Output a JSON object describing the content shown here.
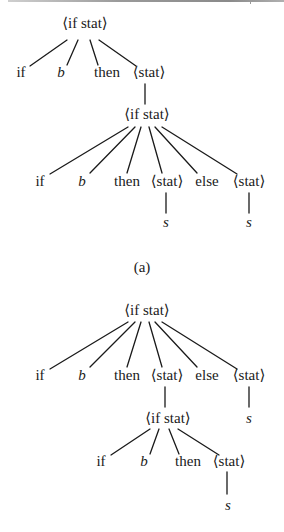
{
  "figure": {
    "caption_a": "(a)",
    "trees": [
      {
        "id": "tree-a",
        "nodes": [
          {
            "id": "a_root",
            "label": "⟨if stat⟩",
            "x": 85,
            "y": 28,
            "italic": false
          },
          {
            "id": "a_if",
            "label": "if",
            "x": 21,
            "y": 77,
            "italic": false
          },
          {
            "id": "a_b",
            "label": "b",
            "x": 61,
            "y": 77,
            "italic": true
          },
          {
            "id": "a_then",
            "label": "then",
            "x": 107,
            "y": 77,
            "italic": false
          },
          {
            "id": "a_stat",
            "label": "⟨stat⟩",
            "x": 149,
            "y": 77,
            "italic": false
          },
          {
            "id": "a_if2",
            "label": "⟨if stat⟩",
            "x": 147,
            "y": 119,
            "italic": false
          },
          {
            "id": "a2_if",
            "label": "if",
            "x": 40,
            "y": 186,
            "italic": false
          },
          {
            "id": "a2_b",
            "label": "b",
            "x": 82,
            "y": 186,
            "italic": true
          },
          {
            "id": "a2_then",
            "label": "then",
            "x": 127,
            "y": 186,
            "italic": false
          },
          {
            "id": "a2_stat1",
            "label": "⟨stat⟩",
            "x": 167,
            "y": 186,
            "italic": false
          },
          {
            "id": "a2_else",
            "label": "else",
            "x": 207,
            "y": 186,
            "italic": false
          },
          {
            "id": "a2_stat2",
            "label": "⟨stat⟩",
            "x": 249,
            "y": 186,
            "italic": false
          },
          {
            "id": "a2_s1",
            "label": "s",
            "x": 166,
            "y": 227,
            "italic": true
          },
          {
            "id": "a2_s2",
            "label": "s",
            "x": 249,
            "y": 227,
            "italic": true
          }
        ],
        "edges": [
          [
            67,
            40,
            30,
            66
          ],
          [
            78,
            40,
            67,
            65
          ],
          [
            90,
            40,
            98,
            65
          ],
          [
            99,
            40,
            136,
            66
          ],
          [
            145,
            84,
            145,
            104
          ],
          [
            128,
            127,
            50,
            174
          ],
          [
            135,
            127,
            90,
            173
          ],
          [
            141,
            127,
            127,
            173
          ],
          [
            149,
            127,
            162,
            173
          ],
          [
            155,
            127,
            197,
            173
          ],
          [
            162,
            127,
            237,
            174
          ],
          [
            166,
            193,
            166,
            213
          ],
          [
            249,
            193,
            249,
            213
          ]
        ]
      },
      {
        "id": "tree-b",
        "nodes": [
          {
            "id": "b_root",
            "label": "⟨if stat⟩",
            "x": 147,
            "y": 315,
            "italic": false
          },
          {
            "id": "b_if",
            "label": "if",
            "x": 40,
            "y": 380,
            "italic": false
          },
          {
            "id": "b_b",
            "label": "b",
            "x": 82,
            "y": 380,
            "italic": true
          },
          {
            "id": "b_then",
            "label": "then",
            "x": 127,
            "y": 380,
            "italic": false
          },
          {
            "id": "b_stat1",
            "label": "⟨stat⟩",
            "x": 167,
            "y": 380,
            "italic": false
          },
          {
            "id": "b_else",
            "label": "else",
            "x": 207,
            "y": 380,
            "italic": false
          },
          {
            "id": "b_stat2",
            "label": "⟨stat⟩",
            "x": 249,
            "y": 380,
            "italic": false
          },
          {
            "id": "b_if2",
            "label": "⟨if stat⟩",
            "x": 168,
            "y": 423,
            "italic": false
          },
          {
            "id": "b_s2",
            "label": "s",
            "x": 249,
            "y": 423,
            "italic": true
          },
          {
            "id": "b2_if",
            "label": "if",
            "x": 101,
            "y": 466,
            "italic": false
          },
          {
            "id": "b2_b",
            "label": "b",
            "x": 144,
            "y": 466,
            "italic": true
          },
          {
            "id": "b2_then",
            "label": "then",
            "x": 188,
            "y": 466,
            "italic": false
          },
          {
            "id": "b2_stat",
            "label": "⟨stat⟩",
            "x": 229,
            "y": 466,
            "italic": false
          },
          {
            "id": "b2_s",
            "label": "s",
            "x": 228,
            "y": 510,
            "italic": true
          }
        ],
        "edges": [
          [
            128,
            322,
            50,
            369
          ],
          [
            135,
            322,
            90,
            367
          ],
          [
            141,
            322,
            127,
            367
          ],
          [
            149,
            322,
            162,
            367
          ],
          [
            155,
            322,
            197,
            367
          ],
          [
            162,
            322,
            237,
            369
          ],
          [
            165,
            387,
            165,
            407
          ],
          [
            249,
            387,
            249,
            407
          ],
          [
            150,
            429,
            111,
            455
          ],
          [
            159,
            429,
            150,
            454
          ],
          [
            169,
            429,
            179,
            454
          ],
          [
            178,
            429,
            219,
            455
          ],
          [
            227,
            472,
            227,
            494
          ]
        ]
      }
    ]
  },
  "captions": {
    "a": {
      "label": "(a)",
      "x": 142,
      "y": 272
    }
  },
  "colors": {
    "ink": "#1a1a1a",
    "background": "#ffffff",
    "rule": "#9a9a9a"
  }
}
